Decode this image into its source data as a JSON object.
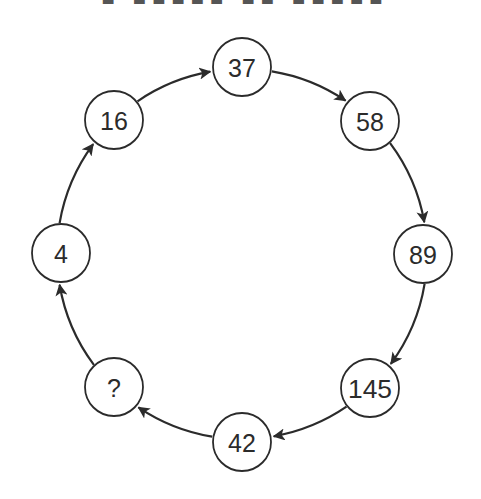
{
  "diagram": {
    "type": "cycle",
    "title_clipped": true,
    "colors": {
      "stroke": "#2b2b2b",
      "background": "#ffffff",
      "node_fill": "#ffffff"
    },
    "nodes": [
      {
        "id": "n1",
        "label": "4",
        "cx": 61,
        "cy": 253
      },
      {
        "id": "n2",
        "label": "16",
        "cx": 114,
        "cy": 120
      },
      {
        "id": "n3",
        "label": "37",
        "cx": 242,
        "cy": 67
      },
      {
        "id": "n4",
        "label": "58",
        "cx": 370,
        "cy": 121
      },
      {
        "id": "n5",
        "label": "89",
        "cx": 423,
        "cy": 254
      },
      {
        "id": "n6",
        "label": "145",
        "cx": 370,
        "cy": 388
      },
      {
        "id": "n7",
        "label": "42",
        "cx": 242,
        "cy": 442
      },
      {
        "id": "n8",
        "label": "?",
        "cx": 114,
        "cy": 387
      }
    ],
    "edges": [
      {
        "from": "4",
        "to": "16"
      },
      {
        "from": "16",
        "to": "37"
      },
      {
        "from": "37",
        "to": "58"
      },
      {
        "from": "58",
        "to": "89"
      },
      {
        "from": "89",
        "to": "145"
      },
      {
        "from": "145",
        "to": "42"
      },
      {
        "from": "42",
        "to": "?"
      },
      {
        "from": "?",
        "to": "4"
      }
    ]
  }
}
